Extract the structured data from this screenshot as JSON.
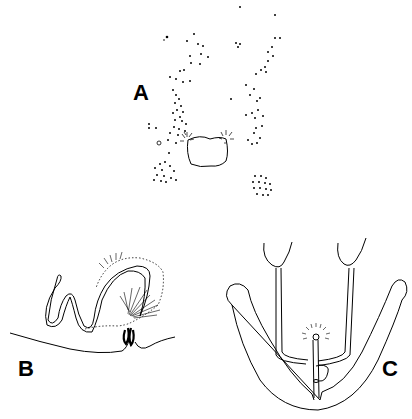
{
  "figure": {
    "panels": [
      {
        "id": "A",
        "label": "A",
        "description": "dorsal view with setae dot pattern and central plate"
      },
      {
        "id": "B",
        "label": "B",
        "description": "lateral view of coiled duct with setose lobe"
      },
      {
        "id": "C",
        "label": "C",
        "description": "ventral view of paired ducts and U-shaped sclerite"
      }
    ],
    "colors": {
      "ink": "#000000",
      "background": "#ffffff"
    }
  }
}
